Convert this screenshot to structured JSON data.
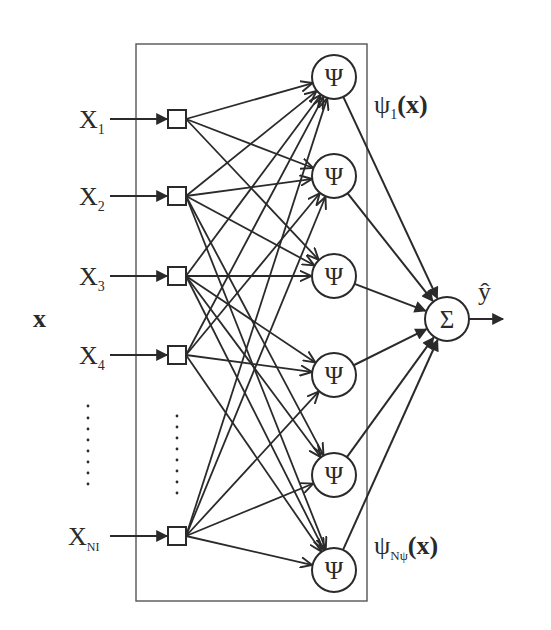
{
  "diagram": {
    "colors": {
      "stroke": "#2a2a2a",
      "box": "#555555",
      "background": "#ffffff"
    },
    "input_vector_label": "x",
    "inputs": [
      {
        "id": "x1",
        "label": "X",
        "sub": "1",
        "y": 119
      },
      {
        "id": "x2",
        "label": "X",
        "sub": "2",
        "y": 196
      },
      {
        "id": "x3",
        "label": "X",
        "sub": "3",
        "y": 276
      },
      {
        "id": "x4",
        "label": "X",
        "sub": "4",
        "y": 355
      },
      {
        "id": "xn",
        "label": "X",
        "sub": "NI",
        "y": 536
      }
    ],
    "ellipsis": "⋮",
    "hidden_nodes": [
      {
        "id": "psi1",
        "symbol": "Ψ",
        "y": 77
      },
      {
        "id": "psi2",
        "symbol": "Ψ",
        "y": 176
      },
      {
        "id": "psi3",
        "symbol": "Ψ",
        "y": 276
      },
      {
        "id": "psi4",
        "symbol": "Ψ",
        "y": 375
      },
      {
        "id": "psi5",
        "symbol": "Ψ",
        "y": 475
      },
      {
        "id": "psi6",
        "symbol": "Ψ",
        "y": 570
      }
    ],
    "hidden_labels": {
      "first": {
        "psi": "ψ",
        "sub": "1",
        "arg": "(x)"
      },
      "last": {
        "psi": "ψ",
        "sub": "Nψ",
        "arg": "(x)"
      }
    },
    "output_node": {
      "symbol": "Σ",
      "label": "ŷ"
    },
    "edges": [
      [
        0,
        0
      ],
      [
        0,
        1
      ],
      [
        0,
        2
      ],
      [
        1,
        0
      ],
      [
        1,
        1
      ],
      [
        1,
        2
      ],
      [
        1,
        4
      ],
      [
        1,
        5
      ],
      [
        2,
        0
      ],
      [
        2,
        2
      ],
      [
        2,
        3
      ],
      [
        2,
        4
      ],
      [
        2,
        5
      ],
      [
        3,
        0
      ],
      [
        3,
        1
      ],
      [
        3,
        3
      ],
      [
        3,
        5
      ],
      [
        4,
        0
      ],
      [
        4,
        1
      ],
      [
        4,
        3
      ],
      [
        4,
        4
      ],
      [
        4,
        5
      ]
    ]
  }
}
